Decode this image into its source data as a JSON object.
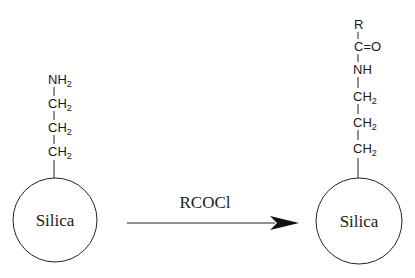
{
  "reaction": {
    "reagent": "RCOCl",
    "arrow": "right"
  },
  "reactant": {
    "core_label": "Silica",
    "chain": [
      {
        "atom": "NH",
        "sub": "2"
      },
      {
        "atom": "CH",
        "sub": "2"
      },
      {
        "atom": "CH",
        "sub": "2"
      },
      {
        "atom": "CH",
        "sub": "2"
      }
    ]
  },
  "product": {
    "core_label": "Silica",
    "chain": [
      {
        "atom": "R",
        "sub": ""
      },
      {
        "atom": "C=O",
        "sub": ""
      },
      {
        "atom": "NH",
        "sub": ""
      },
      {
        "atom": "CH",
        "sub": "2"
      },
      {
        "atom": "CH",
        "sub": "2"
      },
      {
        "atom": "CH",
        "sub": "2"
      }
    ]
  },
  "colors": {
    "line": "#222222",
    "text": "#1a1a1a",
    "background": "#ffffff"
  }
}
